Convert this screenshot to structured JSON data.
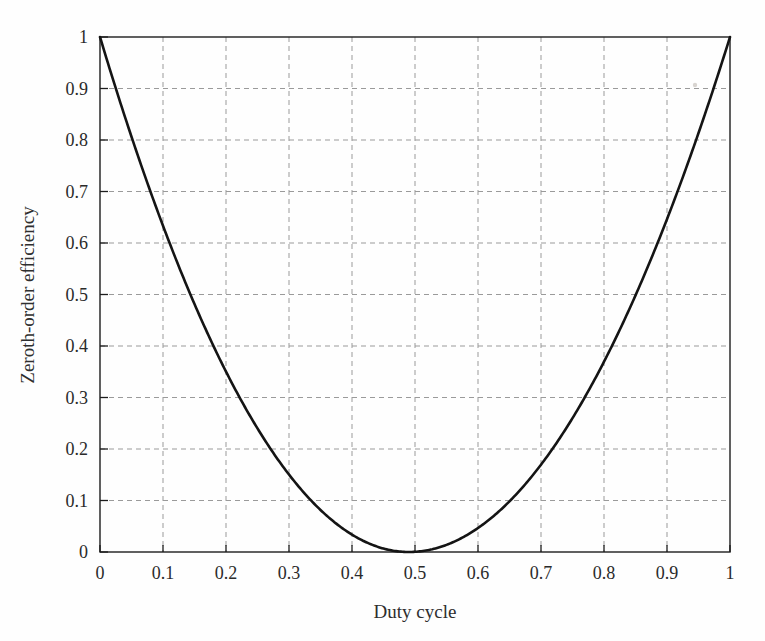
{
  "figure": {
    "background_color": "#fefefe",
    "frame_color": "#1d1d1d",
    "grid_color": "#9a9a9a",
    "curve_color": "#141414"
  },
  "chart_data": {
    "type": "line",
    "title": "",
    "xlabel": "Duty cycle",
    "ylabel": "Zeroth-order efficiency",
    "xlim": [
      0,
      1
    ],
    "ylim": [
      0,
      1
    ],
    "grid": true,
    "legend": "none",
    "xticks": [
      0,
      0.1,
      0.2,
      0.3,
      0.4,
      0.5,
      0.6,
      0.7,
      0.8,
      0.9,
      1
    ],
    "yticks": [
      0,
      0.1,
      0.2,
      0.3,
      0.4,
      0.5,
      0.6,
      0.7,
      0.8,
      0.9,
      1
    ],
    "xtick_labels": [
      "0",
      "0.1",
      "0.2",
      "0.3",
      "0.4",
      "0.5",
      "0.6",
      "0.7",
      "0.8",
      "0.9",
      "1"
    ],
    "ytick_labels": [
      "0",
      "0.1",
      "0.2",
      "0.3",
      "0.4",
      "0.5",
      "0.6",
      "0.7",
      "0.8",
      "0.9",
      "1"
    ],
    "series": [
      {
        "name": "Zeroth-order efficiency",
        "x": [
          0,
          0.025,
          0.05,
          0.075,
          0.1,
          0.125,
          0.15,
          0.175,
          0.2,
          0.225,
          0.25,
          0.275,
          0.3,
          0.325,
          0.35,
          0.375,
          0.4,
          0.425,
          0.45,
          0.475,
          0.49,
          0.5,
          0.525,
          0.55,
          0.575,
          0.6,
          0.625,
          0.65,
          0.675,
          0.7,
          0.725,
          0.75,
          0.775,
          0.8,
          0.825,
          0.85,
          0.875,
          0.9,
          0.925,
          0.95,
          0.975,
          1
        ],
        "y": [
          1.0,
          0.9,
          0.81,
          0.72,
          0.64,
          0.5625,
          0.49,
          0.4225,
          0.36,
          0.3025,
          0.25,
          0.2025,
          0.16,
          0.1225,
          0.09,
          0.0625,
          0.04,
          0.0225,
          0.01,
          0.0025,
          0.0,
          0.0004,
          0.0025,
          0.01,
          0.0225,
          0.04,
          0.0625,
          0.09,
          0.1225,
          0.16,
          0.2025,
          0.25,
          0.3025,
          0.36,
          0.4225,
          0.49,
          0.5625,
          0.64,
          0.72,
          0.81,
          0.9,
          1.0
        ]
      }
    ],
    "annotations": {
      "minimum_x": 0.49,
      "minimum_y": 0.0,
      "endpoint_left_y": 1.0,
      "endpoint_right_y": 1.0
    }
  }
}
